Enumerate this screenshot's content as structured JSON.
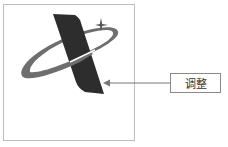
{
  "diagram": {
    "callout": {
      "label": "调整"
    },
    "colors": {
      "frame": "#bdbdbd",
      "bar": "#2d2d2d",
      "ring": "#6e6e6e",
      "arrow": "#777777",
      "box_border": "#8a8a8a"
    }
  }
}
